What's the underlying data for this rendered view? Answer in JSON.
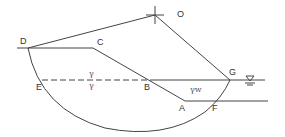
{
  "diagram": {
    "type": "slope stability circular slip surface",
    "points": {
      "O": "O",
      "D": "D",
      "C": "C",
      "E": "E",
      "B": "B",
      "A": "A",
      "F": "F",
      "G": "G"
    },
    "symbols": {
      "gamma_above": "γ",
      "gamma_below": "γ",
      "gamma_w": "γw",
      "water_table": "∇"
    },
    "colors": {
      "line": "#444444",
      "text": "#333333"
    }
  }
}
